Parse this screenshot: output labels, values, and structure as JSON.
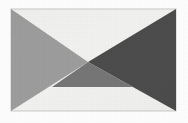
{
  "image": {
    "title": "Bowtie Geometric Figure",
    "width": 188,
    "height": 123,
    "page_background": "#fdfdfd",
    "plate": {
      "x": 11,
      "y": 9,
      "width": 165,
      "height": 102,
      "background": "#f1f1ef",
      "border_color": "#c9c9c5"
    }
  },
  "chart_data": {
    "type": "diagram",
    "crossing_point": [
      88,
      62
    ],
    "xlim": [
      11,
      176
    ],
    "ylim": [
      9,
      111
    ],
    "grid": false,
    "legend": "none",
    "regions": [
      {
        "name": "background-light",
        "label": "Light background region",
        "fill": "#f1f1ef",
        "shape": "rectangle",
        "points": [
          [
            11,
            9
          ],
          [
            176,
            9
          ],
          [
            176,
            111
          ],
          [
            11,
            111
          ]
        ]
      },
      {
        "name": "left-triangle",
        "label": "Medium gray left triangle",
        "fill": "#9d9d9d",
        "shape": "triangle",
        "points": [
          [
            11,
            9
          ],
          [
            88,
            62
          ],
          [
            11,
            111
          ]
        ]
      },
      {
        "name": "right-triangle",
        "label": "Dark gray right triangle",
        "fill": "#4c4c4c",
        "shape": "triangle",
        "points": [
          [
            176,
            9
          ],
          [
            176,
            111
          ],
          [
            88,
            62
          ]
        ]
      },
      {
        "name": "bottom-center-triangle",
        "label": "Mid gray lower-center triangle",
        "fill": "#767676",
        "shape": "triangle",
        "points": [
          [
            88,
            62
          ],
          [
            52,
            87
          ],
          [
            133,
            87
          ]
        ]
      },
      {
        "name": "top-wedge-light",
        "label": "Upper light wedge between gray triangles",
        "fill": "#f1f1ef",
        "shape": "triangle",
        "points": [
          [
            38,
            9
          ],
          [
            134,
            9
          ],
          [
            88,
            62
          ]
        ]
      }
    ],
    "edges": [
      {
        "name": "top-left-diagonal",
        "from": [
          11,
          9
        ],
        "to": [
          88,
          62
        ]
      },
      {
        "name": "top-right-diagonal",
        "from": [
          176,
          9
        ],
        "to": [
          88,
          62
        ]
      },
      {
        "name": "bottom-left-diagonal",
        "from": [
          11,
          111
        ],
        "to": [
          88,
          62
        ]
      },
      {
        "name": "bottom-right-diagonal",
        "from": [
          176,
          111
        ],
        "to": [
          88,
          62
        ]
      },
      {
        "name": "center-bottom-horizontal",
        "from": [
          52,
          87
        ],
        "to": [
          133,
          87
        ]
      }
    ],
    "palette": {
      "light": "#f1f1ef",
      "medium_gray": "#9d9d9d",
      "mid_gray": "#767676",
      "dark_gray": "#4c4c4c"
    }
  }
}
